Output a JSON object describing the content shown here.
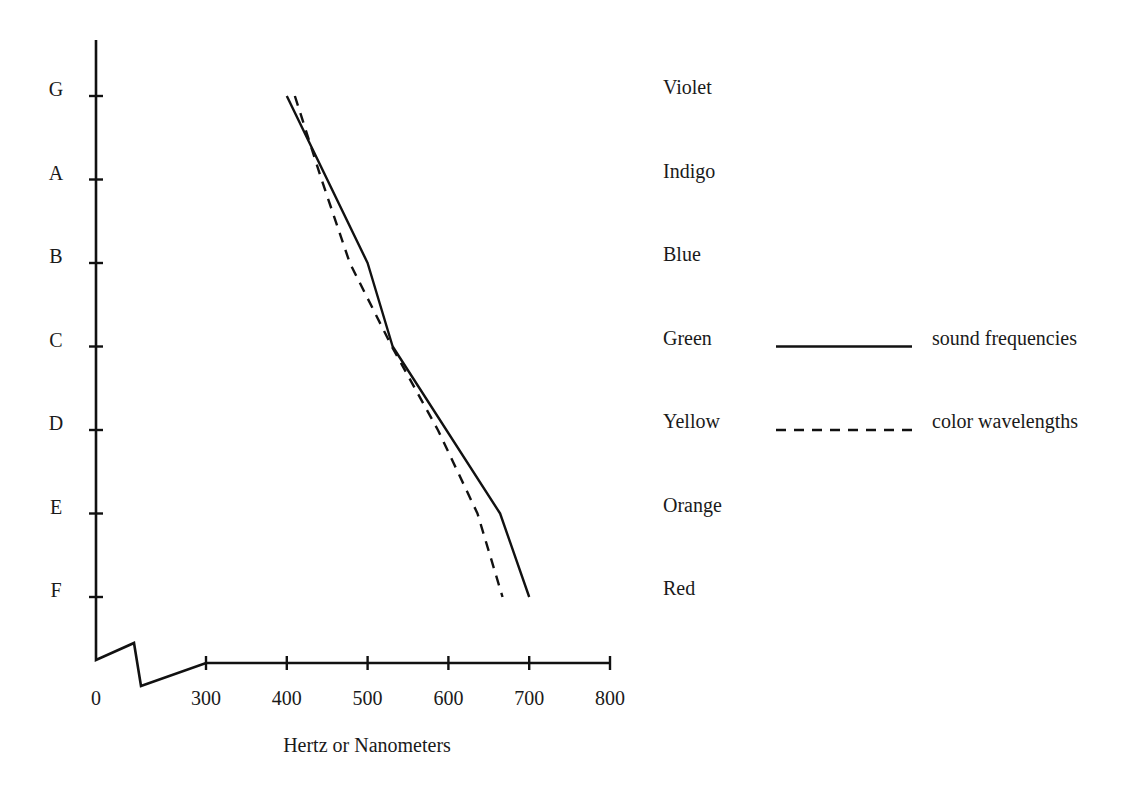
{
  "chart_data": {
    "type": "line",
    "title": "",
    "xlabel": "Hertz or Nanometers",
    "ylabel": "",
    "xlim": [
      300,
      800
    ],
    "x_axis_break": true,
    "x_ticks": [
      0,
      300,
      400,
      500,
      600,
      700,
      800
    ],
    "x_tick_labels": [
      "0",
      "300",
      "400",
      "500",
      "600",
      "700",
      "800"
    ],
    "y_categories": [
      "G",
      "A",
      "B",
      "C",
      "D",
      "E",
      "F"
    ],
    "color_labels": [
      "Violet",
      "Indigo",
      "Blue",
      "Green",
      "Yellow",
      "Orange",
      "Red"
    ],
    "grid": false,
    "legend_position": "right",
    "series": [
      {
        "name": "sound frequencies",
        "style": "solid",
        "points": [
          {
            "y": "G",
            "x": 400
          },
          {
            "y": "B",
            "x": 500
          },
          {
            "y": "C",
            "x": 531
          },
          {
            "y": "E",
            "x": 664
          },
          {
            "y": "F",
            "x": 700
          }
        ]
      },
      {
        "name": "color wavelengths",
        "style": "dashed",
        "points": [
          {
            "y": "G",
            "x": 410
          },
          {
            "y": "A",
            "x": 443
          },
          {
            "y": "B",
            "x": 478
          },
          {
            "y": "C",
            "x": 530
          },
          {
            "y": "D",
            "x": 587
          },
          {
            "y": "E",
            "x": 636
          },
          {
            "y": "F",
            "x": 667
          }
        ]
      }
    ],
    "legend": [
      {
        "label": "sound frequencies",
        "style": "solid"
      },
      {
        "label": "color wavelengths",
        "style": "dashed"
      }
    ]
  }
}
